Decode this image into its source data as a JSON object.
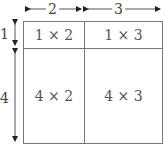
{
  "diagram": {
    "top_dimensions": [
      "2",
      "3"
    ],
    "left_dimensions": [
      "1",
      "4"
    ],
    "cells": [
      {
        "label": "1 × 2"
      },
      {
        "label": "1 × 3"
      },
      {
        "label": "4 × 2"
      },
      {
        "label": "4 × 3"
      }
    ],
    "colors": {
      "line": "#777777",
      "text": "#555555",
      "arrow": "#222222"
    }
  }
}
